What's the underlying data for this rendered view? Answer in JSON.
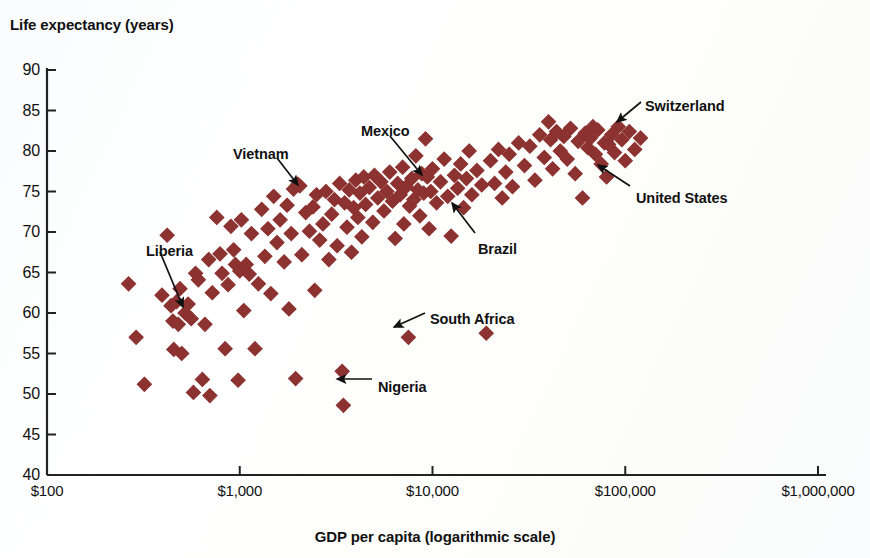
{
  "chart_data": {
    "type": "scatter",
    "title": "",
    "xlabel": "GDP per capita (logarithmic scale)",
    "ylabel": "Life expectancy (years)",
    "xscale": "log",
    "xlim": [
      100,
      1000000
    ],
    "ylim": [
      40,
      90
    ],
    "grid": false,
    "legend": "none",
    "marker": {
      "shape": "diamond",
      "color": "#8C3230",
      "size": 7
    },
    "xticks": [
      {
        "value": 100,
        "label": "$100"
      },
      {
        "value": 1000,
        "label": "$1,000"
      },
      {
        "value": 10000,
        "label": "$10,000"
      },
      {
        "value": 100000,
        "label": "$100,000"
      },
      {
        "value": 1000000,
        "label": "$1,000,000"
      }
    ],
    "yticks": [
      {
        "value": 90,
        "label": "90"
      },
      {
        "value": 85,
        "label": "85"
      },
      {
        "value": 80,
        "label": "80"
      },
      {
        "value": 75,
        "label": "75"
      },
      {
        "value": 70,
        "label": "70"
      },
      {
        "value": 65,
        "label": "65"
      },
      {
        "value": 60,
        "label": "60"
      },
      {
        "value": 55,
        "label": "55"
      },
      {
        "value": 50,
        "label": "50"
      },
      {
        "value": 45,
        "label": "45"
      },
      {
        "value": 40,
        "label": "40"
      }
    ],
    "annotations": [
      {
        "text": "Liberia",
        "label_x": 146,
        "label_y": 243,
        "tip_x": 183,
        "tip_y": 307,
        "tail_x": 160,
        "tail_y": 252
      },
      {
        "text": "Vietnam",
        "label_x": 233,
        "label_y": 146,
        "tip_x": 298,
        "tip_y": 185,
        "tail_x": 277,
        "tail_y": 158
      },
      {
        "text": "Mexico",
        "label_x": 361,
        "label_y": 123,
        "tip_x": 422,
        "tip_y": 175,
        "tail_x": 390,
        "tail_y": 136
      },
      {
        "text": "Brazil",
        "label_x": 478,
        "label_y": 241,
        "tip_x": 452,
        "tip_y": 203,
        "tail_x": 475,
        "tail_y": 233
      },
      {
        "text": "South Africa",
        "label_x": 430,
        "label_y": 311,
        "tip_x": 394,
        "tip_y": 327,
        "tail_x": 425,
        "tail_y": 313
      },
      {
        "text": "Nigeria",
        "label_x": 378,
        "label_y": 379,
        "tip_x": 337,
        "tip_y": 379,
        "tail_x": 372,
        "tail_y": 379
      },
      {
        "text": "Switzerland",
        "label_x": 645,
        "label_y": 98,
        "tip_x": 617,
        "tip_y": 122,
        "tail_x": 641,
        "tail_y": 102
      },
      {
        "text": "United States",
        "label_x": 636,
        "label_y": 190,
        "tip_x": 598,
        "tip_y": 165,
        "tail_x": 630,
        "tail_y": 186
      }
    ],
    "points": [
      {
        "gdp": 265,
        "life": 63.6
      },
      {
        "gdp": 290,
        "life": 57.0
      },
      {
        "gdp": 320,
        "life": 51.2
      },
      {
        "gdp": 395,
        "life": 62.2
      },
      {
        "gdp": 420,
        "life": 69.6
      },
      {
        "gdp": 440,
        "life": 60.9
      },
      {
        "gdp": 450,
        "life": 59.0
      },
      {
        "gdp": 455,
        "life": 55.5
      },
      {
        "gdp": 470,
        "life": 61.4
      },
      {
        "gdp": 480,
        "life": 58.6
      },
      {
        "gdp": 490,
        "life": 63.0
      },
      {
        "gdp": 500,
        "life": 55.0
      },
      {
        "gdp": 520,
        "life": 60.0
      },
      {
        "gdp": 540,
        "life": 61.1
      },
      {
        "gdp": 560,
        "life": 59.3
      },
      {
        "gdp": 575,
        "life": 50.2
      },
      {
        "gdp": 590,
        "life": 64.9
      },
      {
        "gdp": 610,
        "life": 64.1
      },
      {
        "gdp": 640,
        "life": 51.8
      },
      {
        "gdp": 660,
        "life": 58.6
      },
      {
        "gdp": 690,
        "life": 66.6
      },
      {
        "gdp": 700,
        "life": 49.8
      },
      {
        "gdp": 720,
        "life": 62.5
      },
      {
        "gdp": 760,
        "life": 71.8
      },
      {
        "gdp": 790,
        "life": 67.3
      },
      {
        "gdp": 810,
        "life": 64.9
      },
      {
        "gdp": 840,
        "life": 55.6
      },
      {
        "gdp": 870,
        "life": 63.5
      },
      {
        "gdp": 900,
        "life": 70.7
      },
      {
        "gdp": 930,
        "life": 67.8
      },
      {
        "gdp": 950,
        "life": 66.0
      },
      {
        "gdp": 980,
        "life": 51.7
      },
      {
        "gdp": 1000,
        "life": 65.2
      },
      {
        "gdp": 1020,
        "life": 71.5
      },
      {
        "gdp": 1050,
        "life": 60.3
      },
      {
        "gdp": 1080,
        "life": 66.0
      },
      {
        "gdp": 1120,
        "life": 64.8
      },
      {
        "gdp": 1150,
        "life": 69.8
      },
      {
        "gdp": 1200,
        "life": 55.6
      },
      {
        "gdp": 1250,
        "life": 63.6
      },
      {
        "gdp": 1300,
        "life": 72.8
      },
      {
        "gdp": 1350,
        "life": 67.0
      },
      {
        "gdp": 1400,
        "life": 70.4
      },
      {
        "gdp": 1450,
        "life": 62.4
      },
      {
        "gdp": 1500,
        "life": 74.4
      },
      {
        "gdp": 1560,
        "life": 68.7
      },
      {
        "gdp": 1620,
        "life": 71.5
      },
      {
        "gdp": 1700,
        "life": 66.3
      },
      {
        "gdp": 1760,
        "life": 73.3
      },
      {
        "gdp": 1800,
        "life": 60.5
      },
      {
        "gdp": 1850,
        "life": 69.8
      },
      {
        "gdp": 1900,
        "life": 75.3
      },
      {
        "gdp": 1950,
        "life": 51.9
      },
      {
        "gdp": 2000,
        "life": 75.9
      },
      {
        "gdp": 2050,
        "life": 75.7
      },
      {
        "gdp": 2100,
        "life": 67.2
      },
      {
        "gdp": 2200,
        "life": 72.4
      },
      {
        "gdp": 2300,
        "life": 70.1
      },
      {
        "gdp": 2400,
        "life": 73.1
      },
      {
        "gdp": 2450,
        "life": 62.8
      },
      {
        "gdp": 2500,
        "life": 74.6
      },
      {
        "gdp": 2600,
        "life": 69.0
      },
      {
        "gdp": 2700,
        "life": 71.0
      },
      {
        "gdp": 2800,
        "life": 75.0
      },
      {
        "gdp": 2900,
        "life": 66.6
      },
      {
        "gdp": 3000,
        "life": 72.2
      },
      {
        "gdp": 3100,
        "life": 74.0
      },
      {
        "gdp": 3200,
        "life": 68.3
      },
      {
        "gdp": 3300,
        "life": 76.0
      },
      {
        "gdp": 3400,
        "life": 52.8
      },
      {
        "gdp": 3450,
        "life": 48.6
      },
      {
        "gdp": 3500,
        "life": 73.6
      },
      {
        "gdp": 3600,
        "life": 70.6
      },
      {
        "gdp": 3700,
        "life": 75.2
      },
      {
        "gdp": 3800,
        "life": 67.5
      },
      {
        "gdp": 3900,
        "life": 73.0
      },
      {
        "gdp": 4000,
        "life": 76.4
      },
      {
        "gdp": 4100,
        "life": 71.8
      },
      {
        "gdp": 4200,
        "life": 74.8
      },
      {
        "gdp": 4300,
        "life": 69.4
      },
      {
        "gdp": 4400,
        "life": 76.8
      },
      {
        "gdp": 4500,
        "life": 73.4
      },
      {
        "gdp": 4700,
        "life": 75.5
      },
      {
        "gdp": 4900,
        "life": 71.2
      },
      {
        "gdp": 5000,
        "life": 77.0
      },
      {
        "gdp": 5200,
        "life": 74.2
      },
      {
        "gdp": 5400,
        "life": 76.2
      },
      {
        "gdp": 5600,
        "life": 72.6
      },
      {
        "gdp": 5800,
        "life": 75.0
      },
      {
        "gdp": 6000,
        "life": 77.4
      },
      {
        "gdp": 6200,
        "life": 73.8
      },
      {
        "gdp": 6400,
        "life": 69.2
      },
      {
        "gdp": 6600,
        "life": 76.0
      },
      {
        "gdp": 6800,
        "life": 74.6
      },
      {
        "gdp": 7000,
        "life": 78.0
      },
      {
        "gdp": 7100,
        "life": 71.0
      },
      {
        "gdp": 7300,
        "life": 75.6
      },
      {
        "gdp": 7500,
        "life": 57.0
      },
      {
        "gdp": 7600,
        "life": 73.2
      },
      {
        "gdp": 7800,
        "life": 76.6
      },
      {
        "gdp": 8000,
        "life": 74.0
      },
      {
        "gdp": 8200,
        "life": 79.4
      },
      {
        "gdp": 8400,
        "life": 75.2
      },
      {
        "gdp": 8600,
        "life": 72.0
      },
      {
        "gdp": 8800,
        "life": 77.2
      },
      {
        "gdp": 9000,
        "life": 74.8
      },
      {
        "gdp": 9200,
        "life": 81.5
      },
      {
        "gdp": 9400,
        "life": 76.8
      },
      {
        "gdp": 9600,
        "life": 70.4
      },
      {
        "gdp": 9800,
        "life": 75.0
      },
      {
        "gdp": 10000,
        "life": 77.8
      },
      {
        "gdp": 10500,
        "life": 73.6
      },
      {
        "gdp": 11000,
        "life": 76.2
      },
      {
        "gdp": 11500,
        "life": 79.0
      },
      {
        "gdp": 12000,
        "life": 74.4
      },
      {
        "gdp": 12500,
        "life": 69.5
      },
      {
        "gdp": 13000,
        "life": 77.0
      },
      {
        "gdp": 13500,
        "life": 75.4
      },
      {
        "gdp": 14000,
        "life": 78.4
      },
      {
        "gdp": 14500,
        "life": 73.0
      },
      {
        "gdp": 15000,
        "life": 76.6
      },
      {
        "gdp": 15500,
        "life": 80.0
      },
      {
        "gdp": 16000,
        "life": 74.6
      },
      {
        "gdp": 17000,
        "life": 77.6
      },
      {
        "gdp": 18000,
        "life": 75.8
      },
      {
        "gdp": 19000,
        "life": 57.5
      },
      {
        "gdp": 20000,
        "life": 78.8
      },
      {
        "gdp": 21000,
        "life": 76.0
      },
      {
        "gdp": 22000,
        "life": 80.2
      },
      {
        "gdp": 23000,
        "life": 74.2
      },
      {
        "gdp": 24000,
        "life": 77.4
      },
      {
        "gdp": 25000,
        "life": 79.6
      },
      {
        "gdp": 26000,
        "life": 75.6
      },
      {
        "gdp": 28000,
        "life": 81.0
      },
      {
        "gdp": 30000,
        "life": 78.2
      },
      {
        "gdp": 32000,
        "life": 80.6
      },
      {
        "gdp": 34000,
        "life": 76.4
      },
      {
        "gdp": 36000,
        "life": 82.0
      },
      {
        "gdp": 38000,
        "life": 79.2
      },
      {
        "gdp": 40000,
        "life": 83.6
      },
      {
        "gdp": 41000,
        "life": 81.4
      },
      {
        "gdp": 42000,
        "life": 77.8
      },
      {
        "gdp": 44000,
        "life": 82.4
      },
      {
        "gdp": 46000,
        "life": 80.0
      },
      {
        "gdp": 48000,
        "life": 81.8
      },
      {
        "gdp": 50000,
        "life": 79.0
      },
      {
        "gdp": 52000,
        "life": 82.8
      },
      {
        "gdp": 55000,
        "life": 77.2
      },
      {
        "gdp": 57000,
        "life": 81.2
      },
      {
        "gdp": 60000,
        "life": 74.2
      },
      {
        "gdp": 62000,
        "life": 82.2
      },
      {
        "gdp": 64000,
        "life": 80.4
      },
      {
        "gdp": 66000,
        "life": 81.6
      },
      {
        "gdp": 68000,
        "life": 83.0
      },
      {
        "gdp": 70000,
        "life": 79.6
      },
      {
        "gdp": 72000,
        "life": 82.6
      },
      {
        "gdp": 75000,
        "life": 78.4
      },
      {
        "gdp": 78000,
        "life": 81.0
      },
      {
        "gdp": 80000,
        "life": 76.8
      },
      {
        "gdp": 82000,
        "life": 80.8
      },
      {
        "gdp": 85000,
        "life": 82.0
      },
      {
        "gdp": 88000,
        "life": 79.8
      },
      {
        "gdp": 92000,
        "life": 83.0
      },
      {
        "gdp": 96000,
        "life": 81.4
      },
      {
        "gdp": 100000,
        "life": 78.8
      },
      {
        "gdp": 105000,
        "life": 82.4
      },
      {
        "gdp": 112000,
        "life": 80.2
      },
      {
        "gdp": 120000,
        "life": 81.6
      }
    ]
  }
}
